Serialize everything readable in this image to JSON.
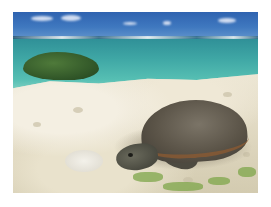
{
  "image": {
    "subject": "sea turtle resting on sandy beach",
    "elements": [
      "sky",
      "clouds",
      "ocean horizon",
      "turquoise lagoon",
      "green shrub",
      "coral sand beach",
      "sea turtle",
      "white rock",
      "green beach vegetation"
    ]
  },
  "colors": {
    "sky": "#3f78bf",
    "sea": "#3fa7a5",
    "shrub": "#2f5427",
    "sand": "#e8e2d0",
    "turtle_shell": "#5a5347",
    "border": "#ffffff"
  }
}
